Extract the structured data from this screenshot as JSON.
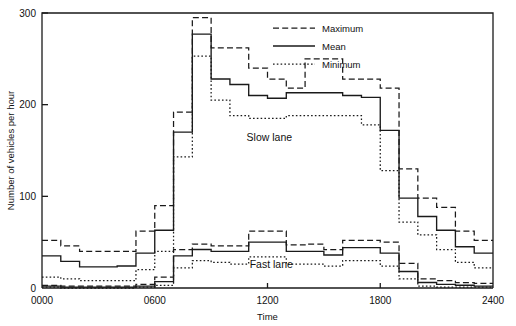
{
  "chart_data": {
    "type": "line",
    "title": "",
    "xlabel": "Time",
    "ylabel": "Number of vehicles per hour",
    "xlim": [
      0,
      24
    ],
    "ylim": [
      0,
      300
    ],
    "xticks": [
      "0000",
      "0600",
      "1200",
      "1800",
      "2400"
    ],
    "xtick_values": [
      0,
      6,
      12,
      18,
      24
    ],
    "yticks": [
      "0",
      "100",
      "200",
      "300"
    ],
    "ytick_values": [
      0,
      100,
      200,
      300
    ],
    "grid": false,
    "step_style": "post",
    "bin_edges": [
      0,
      1,
      2,
      3,
      4,
      5,
      6,
      7,
      8,
      9,
      10,
      11,
      12,
      13,
      14,
      15,
      16,
      17,
      18,
      19,
      20,
      21,
      22,
      23,
      24
    ],
    "legend": {
      "position": "top-right",
      "entries": [
        {
          "label": "Maximum",
          "style": "dashed"
        },
        {
          "label": "Mean",
          "style": "solid"
        },
        {
          "label": "Minimum",
          "style": "dotted"
        }
      ]
    },
    "annotations": [
      {
        "text": "Slow lane",
        "x": 12.1,
        "y": 160
      },
      {
        "text": "Fast lane",
        "x": 12.2,
        "y": 22
      }
    ],
    "groups": [
      {
        "name": "Slow lane",
        "series": [
          {
            "name": "Maximum",
            "style": "dashed",
            "values": [
              52,
              46,
              40,
              40,
              40,
              62,
              90,
              192,
              295,
              262,
              262,
              240,
              228,
              218,
              250,
              250,
              228,
              228,
              218,
              130,
              98,
              88,
              62,
              52
            ]
          },
          {
            "name": "Mean",
            "style": "solid",
            "values": [
              35,
              29,
              23,
              23,
              24,
              38,
              63,
              170,
              277,
              228,
              222,
              210,
              207,
              213,
              213,
              213,
              210,
              208,
              172,
              98,
              78,
              63,
              45,
              38
            ]
          },
          {
            "name": "Minimum",
            "style": "dotted",
            "values": [
              12,
              10,
              8,
              8,
              8,
              20,
              40,
              143,
              253,
              205,
              188,
              185,
              185,
              188,
              188,
              188,
              188,
              178,
              128,
              72,
              58,
              42,
              28,
              22
            ]
          }
        ]
      },
      {
        "name": "Fast lane",
        "series": [
          {
            "name": "Maximum",
            "style": "dashed",
            "values": [
              3,
              2,
              2,
              2,
              2,
              4,
              12,
              42,
              48,
              46,
              46,
              62,
              62,
              47,
              48,
              42,
              52,
              52,
              50,
              27,
              10,
              8,
              6,
              5
            ]
          },
          {
            "name": "Mean",
            "style": "solid",
            "values": [
              2,
              1,
              1,
              1,
              1,
              2,
              7,
              35,
              42,
              40,
              40,
              50,
              50,
              40,
              40,
              36,
              44,
              44,
              38,
              18,
              6,
              4,
              3,
              2
            ]
          },
          {
            "name": "Minimum",
            "style": "dotted",
            "values": [
              1,
              0,
              0,
              0,
              0,
              1,
              3,
              22,
              30,
              28,
              26,
              34,
              34,
              26,
              26,
              24,
              30,
              30,
              24,
              10,
              2,
              1,
              1,
              1
            ]
          }
        ]
      }
    ]
  }
}
